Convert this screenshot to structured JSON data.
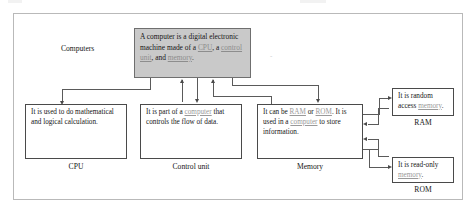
{
  "diagram": {
    "root_label": "Computers",
    "stray_mark": "-",
    "main_node": {
      "segments": [
        {
          "text": "A computer is a digital electronic machine made of a ",
          "link": false
        },
        {
          "text": "CPU",
          "link": true
        },
        {
          "text": ", a ",
          "link": false
        },
        {
          "text": "control unit",
          "link": true
        },
        {
          "text": ", and ",
          "link": false
        },
        {
          "text": "memory",
          "link": true
        },
        {
          "text": ".",
          "link": false
        }
      ]
    },
    "nodes": [
      {
        "id": "cpu",
        "caption": "CPU",
        "segments": [
          {
            "text": "It is used to do mathematical and logical calculation.",
            "link": false
          }
        ]
      },
      {
        "id": "control-unit",
        "caption": "Control unit",
        "segments": [
          {
            "text": "It is part of a ",
            "link": false
          },
          {
            "text": "computer",
            "link": true
          },
          {
            "text": " that controls the flow of data.",
            "link": false
          }
        ]
      },
      {
        "id": "memory",
        "caption": "Memory",
        "segments": [
          {
            "text": "It can be ",
            "link": false
          },
          {
            "text": "RAM",
            "link": true
          },
          {
            "text": " or ",
            "link": false
          },
          {
            "text": "ROM",
            "link": true
          },
          {
            "text": ". It is used in a ",
            "link": false
          },
          {
            "text": "computer",
            "link": true
          },
          {
            "text": " to store information.",
            "link": false
          }
        ]
      },
      {
        "id": "ram",
        "caption": "RAM",
        "segments": [
          {
            "text": "It is random access ",
            "link": false
          },
          {
            "text": "memory",
            "link": true
          },
          {
            "text": ".",
            "link": false
          }
        ]
      },
      {
        "id": "rom",
        "caption": "ROM",
        "segments": [
          {
            "text": "It is read-only ",
            "link": false
          },
          {
            "text": "memory",
            "link": true
          },
          {
            "text": ".",
            "link": false
          }
        ]
      }
    ],
    "colors": {
      "main_fill": "#c9c9c9",
      "node_border": "#4a4a4a",
      "link_text": "#9a9a9a",
      "frame_border": "#b9b9b9",
      "connector": "#5a5a5a"
    }
  }
}
